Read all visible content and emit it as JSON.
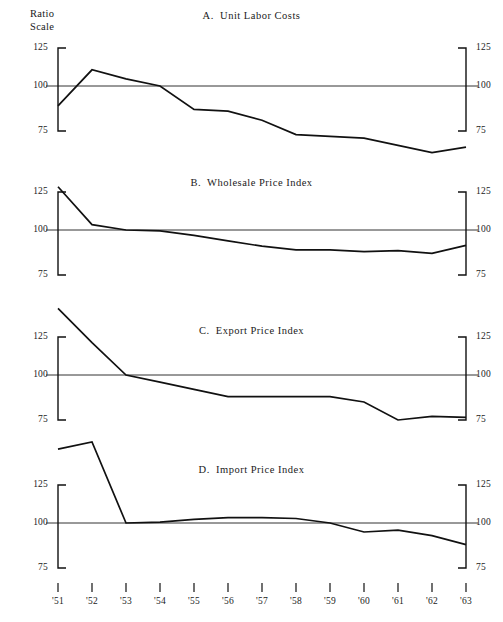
{
  "figure": {
    "axis_note": "Ratio\nScale",
    "background": "#ffffff",
    "line_color": "#111111"
  },
  "chart_data": [
    {
      "type": "line",
      "panel": "A",
      "title": "A.  Unit Labor Costs",
      "xlabel": "",
      "ylabel": "Ratio Scale",
      "ylim": [
        75,
        125
      ],
      "yticks": [
        75,
        100,
        125
      ],
      "ytick_labels_left": [
        "125",
        "100",
        "75"
      ],
      "ytick_labels_right": [
        "125",
        "100",
        "75"
      ],
      "reference_level": 100,
      "grid": false,
      "legend": "none",
      "x": [
        "'51",
        "'52",
        "'53",
        "'54",
        "'55",
        "'56",
        "'57",
        "'58",
        "'59",
        "'60",
        "'61",
        "'62",
        "'63"
      ],
      "values": [
        89,
        109,
        104,
        100,
        87,
        86,
        81,
        73,
        72,
        71,
        67,
        63,
        66
      ]
    },
    {
      "type": "line",
      "panel": "B",
      "title": "B.  Wholesale Price Index",
      "xlabel": "",
      "ylabel": "",
      "ylim": [
        75,
        125
      ],
      "yticks": [
        75,
        100,
        125
      ],
      "ytick_labels_left": [
        "125",
        "100",
        "75"
      ],
      "ytick_labels_right": [
        "125",
        "100",
        "75"
      ],
      "reference_level": 100,
      "grid": false,
      "legend": "none",
      "x": [
        "'51",
        "'52",
        "'53",
        "'54",
        "'55",
        "'56",
        "'57",
        "'58",
        "'59",
        "'60",
        "'61",
        "'62",
        "'63"
      ],
      "values": [
        124,
        103,
        100,
        99.5,
        97,
        94,
        91,
        89,
        89,
        88,
        88.5,
        87,
        91.5
      ]
    },
    {
      "type": "line",
      "panel": "C",
      "title": "C.  Export Price Index",
      "xlabel": "",
      "ylabel": "",
      "ylim": [
        75,
        125
      ],
      "yticks": [
        75,
        100,
        125
      ],
      "ytick_labels_left": [
        "125",
        "100",
        "75"
      ],
      "ytick_labels_right": [
        "125",
        "100",
        "75"
      ],
      "reference_level": 100,
      "grid": false,
      "legend": "none",
      "x": [
        "'51",
        "'52",
        "'53",
        "'54",
        "'55",
        "'56",
        "'57",
        "'58",
        "'59",
        "'60",
        "'61",
        "'62",
        "'63"
      ],
      "values": [
        137,
        118,
        100,
        96,
        92,
        88,
        88,
        88,
        88,
        85,
        75,
        77,
        76.5
      ]
    },
    {
      "type": "line",
      "panel": "D",
      "title": "D.  Import Price Index",
      "xlabel": "",
      "ylabel": "",
      "ylim": [
        75,
        125
      ],
      "yticks": [
        75,
        100,
        125
      ],
      "ytick_labels_left": [
        "125",
        "100",
        "75"
      ],
      "ytick_labels_right": [
        "125",
        "100",
        "75"
      ],
      "reference_level": 100,
      "grid": false,
      "legend": "none",
      "x": [
        "'51",
        "'52",
        "'53",
        "'54",
        "'55",
        "'56",
        "'57",
        "'58",
        "'59",
        "'60",
        "'61",
        "'62",
        "'63"
      ],
      "values": [
        141,
        145,
        100,
        100.5,
        102,
        103,
        103,
        102.5,
        100,
        95,
        96,
        93,
        88
      ]
    }
  ],
  "panels": [
    {
      "id": "A",
      "title": "A.  Unit Labor Costs",
      "y_left": [
        "125",
        "100",
        "75"
      ],
      "y_right": [
        "125",
        "100",
        "75"
      ]
    },
    {
      "id": "B",
      "title": "B.  Wholesale Price Index",
      "y_left": [
        "125",
        "100",
        "75"
      ],
      "y_right": [
        "125",
        "100",
        "75"
      ]
    },
    {
      "id": "C",
      "title": "C.  Export Price Index",
      "y_left": [
        "125",
        "100",
        "75"
      ],
      "y_right": [
        "125",
        "100",
        "75"
      ]
    },
    {
      "id": "D",
      "title": "D.  Import Price Index",
      "y_left": [
        "125",
        "100",
        "75"
      ],
      "y_right": [
        "125",
        "100",
        "75"
      ]
    }
  ],
  "x_axis": {
    "labels": [
      "'51",
      "'52",
      "'53",
      "'54",
      "'55",
      "'56",
      "'57",
      "'58",
      "'59",
      "'60",
      "'61",
      "'62",
      "'63"
    ]
  }
}
